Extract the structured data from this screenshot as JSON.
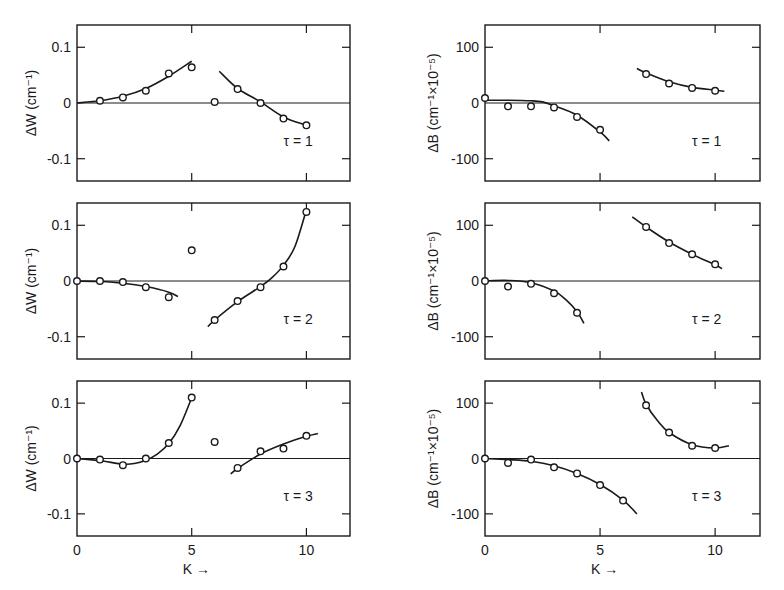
{
  "figure": {
    "xlabel": "K →",
    "colors": {
      "ink": "#1a1a1a",
      "background": "#ffffff"
    }
  },
  "chart_data": [
    {
      "type": "scatter",
      "panel": "top-left",
      "title": "τ = 1",
      "xlabel": "K →",
      "ylabel": "ΔW (cm⁻¹)",
      "xlim": [
        0,
        11.9
      ],
      "ylim": [
        -0.14,
        0.14
      ],
      "xticks": [
        0,
        5,
        10
      ],
      "yticks": [
        -0.1,
        0,
        0.1
      ],
      "ytick_labels": [
        "-0.1",
        "0",
        "0.1"
      ],
      "points": {
        "x": [
          1,
          2,
          3,
          4,
          5,
          6,
          7,
          8,
          9,
          10
        ],
        "y": [
          0.004,
          0.01,
          0.022,
          0.053,
          0.064,
          0.002,
          0.025,
          0.0,
          -0.028,
          -0.04
        ]
      },
      "curves": [
        {
          "x": [
            0,
            1,
            2,
            3,
            4,
            5
          ],
          "y": [
            0.0,
            0.004,
            0.012,
            0.026,
            0.048,
            0.075
          ]
        },
        {
          "x": [
            6.2,
            7,
            8,
            9,
            10
          ],
          "y": [
            0.057,
            0.026,
            0.002,
            -0.025,
            -0.04
          ]
        }
      ]
    },
    {
      "type": "scatter",
      "panel": "top-right",
      "title": "τ = 1",
      "xlabel": "K →",
      "ylabel": "ΔB (cm⁻¹×10⁻⁵)",
      "xlim": [
        0,
        11.95
      ],
      "ylim": [
        -140,
        140
      ],
      "xticks": [
        0,
        5,
        10
      ],
      "yticks": [
        -100,
        0,
        100
      ],
      "ytick_labels": [
        "-100",
        "0",
        "100"
      ],
      "points": {
        "x": [
          0,
          1,
          2,
          3,
          4,
          5,
          7,
          8,
          9,
          10
        ],
        "y": [
          9,
          -6,
          -6,
          -8,
          -25,
          -48,
          52,
          35,
          27,
          22
        ]
      },
      "curves": [
        {
          "x": [
            0,
            1,
            2,
            2.5,
            3,
            4,
            5,
            5.4
          ],
          "y": [
            5,
            5,
            4,
            2,
            -5,
            -22,
            -52,
            -68
          ]
        },
        {
          "x": [
            6.6,
            7,
            8,
            9,
            10,
            10.4
          ],
          "y": [
            62,
            54,
            38,
            28,
            23,
            21
          ]
        }
      ]
    },
    {
      "type": "scatter",
      "panel": "middle-left",
      "title": "τ = 2",
      "xlabel": "K →",
      "ylabel": "ΔW (cm⁻¹)",
      "xlim": [
        0,
        11.9
      ],
      "ylim": [
        -0.14,
        0.14
      ],
      "xticks": [
        0,
        5,
        10
      ],
      "yticks": [
        -0.1,
        0,
        0.1
      ],
      "ytick_labels": [
        "-0.1",
        "0",
        "0.1"
      ],
      "points": {
        "x": [
          0,
          1,
          2,
          3,
          4,
          5,
          6,
          7,
          8,
          9,
          10
        ],
        "y": [
          0.0,
          0.0,
          -0.002,
          -0.011,
          -0.029,
          0.055,
          -0.07,
          -0.036,
          -0.011,
          0.026,
          0.124
        ]
      },
      "curves": [
        {
          "x": [
            0,
            1,
            2,
            3,
            4,
            4.4
          ],
          "y": [
            0.0,
            -0.001,
            -0.004,
            -0.01,
            -0.02,
            -0.028
          ]
        },
        {
          "x": [
            5.7,
            6,
            7,
            8,
            8.5,
            9,
            9.5,
            10
          ],
          "y": [
            -0.082,
            -0.07,
            -0.037,
            -0.01,
            0.006,
            0.028,
            0.062,
            0.128
          ]
        }
      ]
    },
    {
      "type": "scatter",
      "panel": "middle-right",
      "title": "τ = 2",
      "xlabel": "K →",
      "ylabel": "ΔB (cm⁻¹×10⁻⁵)",
      "xlim": [
        0,
        11.95
      ],
      "ylim": [
        -140,
        140
      ],
      "xticks": [
        0,
        5,
        10
      ],
      "yticks": [
        -100,
        0,
        100
      ],
      "ytick_labels": [
        "-100",
        "0",
        "100"
      ],
      "points": {
        "x": [
          0,
          1,
          2,
          3,
          4,
          7,
          8,
          9,
          10
        ],
        "y": [
          0,
          -10,
          -5,
          -22,
          -57,
          97,
          68,
          48,
          30
        ]
      },
      "curves": [
        {
          "x": [
            0,
            1,
            2,
            3,
            3.5,
            4,
            4.3
          ],
          "y": [
            0,
            1,
            -3,
            -18,
            -33,
            -55,
            -76
          ]
        },
        {
          "x": [
            6.4,
            7,
            8,
            9,
            10,
            10.3
          ],
          "y": [
            115,
            97,
            70,
            48,
            29,
            22
          ]
        }
      ]
    },
    {
      "type": "scatter",
      "panel": "bottom-left",
      "title": "τ = 3",
      "xlabel": "K →",
      "ylabel": "ΔW (cm⁻¹)",
      "xlim": [
        0,
        11.9
      ],
      "ylim": [
        -0.14,
        0.14
      ],
      "xticks": [
        0,
        5,
        10
      ],
      "xtick_labels": [
        "0",
        "5",
        "10"
      ],
      "yticks": [
        -0.1,
        0,
        0.1
      ],
      "ytick_labels": [
        "-0.1",
        "0",
        "0.1"
      ],
      "points": {
        "x": [
          0,
          1,
          2,
          3,
          4,
          5,
          6,
          7,
          8,
          9,
          10
        ],
        "y": [
          0.0,
          -0.002,
          -0.012,
          0.0,
          0.028,
          0.11,
          0.03,
          -0.017,
          0.013,
          0.018,
          0.041
        ]
      },
      "curves": [
        {
          "x": [
            0,
            1,
            2,
            2.5,
            3,
            3.5,
            4,
            4.5,
            5
          ],
          "y": [
            0.0,
            -0.004,
            -0.01,
            -0.009,
            -0.003,
            0.008,
            0.027,
            0.06,
            0.11
          ]
        },
        {
          "x": [
            6.7,
            7,
            8,
            9,
            10,
            10.5
          ],
          "y": [
            -0.028,
            -0.018,
            0.008,
            0.026,
            0.04,
            0.045
          ]
        }
      ]
    },
    {
      "type": "scatter",
      "panel": "bottom-right",
      "title": "τ = 3",
      "xlabel": "K →",
      "ylabel": "ΔB (cm⁻¹×10⁻⁵)",
      "xlim": [
        0,
        11.95
      ],
      "ylim": [
        -140,
        140
      ],
      "xticks": [
        0,
        5,
        10
      ],
      "xtick_labels": [
        "0",
        "5",
        "10"
      ],
      "yticks": [
        -100,
        0,
        100
      ],
      "ytick_labels": [
        "-100",
        "0",
        "100"
      ],
      "points": {
        "x": [
          0,
          1,
          2,
          3,
          4,
          5,
          6,
          7,
          8,
          9,
          10
        ],
        "y": [
          0,
          -8,
          -2,
          -16,
          -27,
          -48,
          -76,
          96,
          47,
          23,
          19
        ]
      },
      "curves": [
        {
          "x": [
            0,
            1,
            2,
            3,
            4,
            5,
            6,
            6.6
          ],
          "y": [
            0,
            -2,
            -5,
            -13,
            -27,
            -47,
            -75,
            -100
          ]
        },
        {
          "x": [
            6.8,
            7,
            7.5,
            8,
            9,
            10,
            10.6
          ],
          "y": [
            120,
            98,
            68,
            47,
            25,
            19,
            23
          ]
        }
      ]
    }
  ]
}
